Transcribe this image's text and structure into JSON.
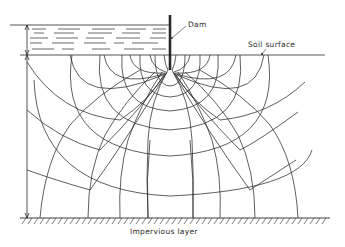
{
  "figure": {
    "type": "flow-net",
    "labels": {
      "dam": "Dam",
      "soil_surface": "Soil surface",
      "impervious_layer": "Impervious layer"
    },
    "colors": {
      "ink": "#2a2a2a",
      "background": "#ffffff"
    }
  }
}
